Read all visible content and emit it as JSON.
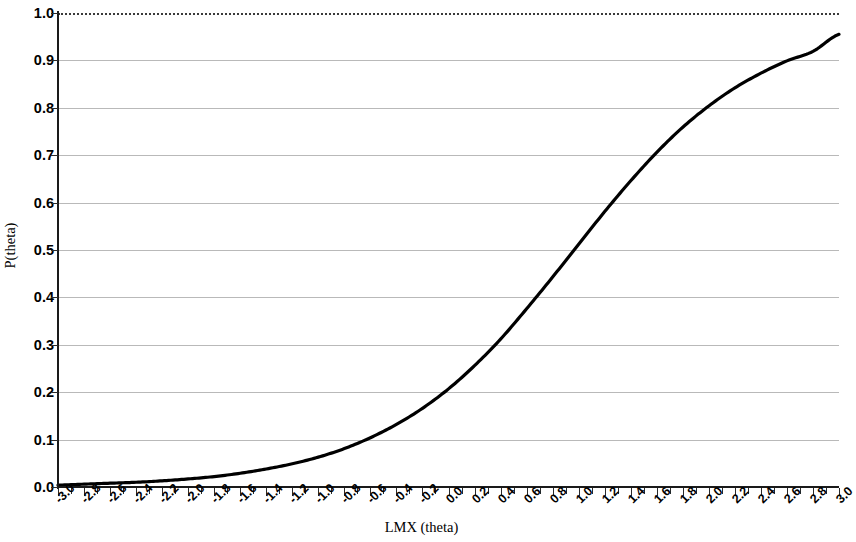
{
  "chart_data": {
    "type": "line",
    "title": "",
    "subtitle": "",
    "xlabel": "LMX (theta)",
    "ylabel": "P(theta)",
    "xlim": [
      -3.0,
      3.0
    ],
    "ylim": [
      0.0,
      1.0
    ],
    "grid": true,
    "legend": null,
    "legend_position": "none",
    "annotations": [],
    "line_color": "#000000",
    "gridline_color": "#b9b9b9",
    "axis_color": "#1a1a1a",
    "x_tick_labels": [
      "-3.0",
      "-2.8",
      "-2.6",
      "-2.4",
      "-2.2",
      "-2.0",
      "-1.8",
      "-1.6",
      "-1.4",
      "-1.2",
      "-1.0",
      "-0.8",
      "-0.6",
      "-0.4",
      "-0.2",
      "0.0",
      "0.2",
      "0.4",
      "0.6",
      "0.8",
      "1.0",
      "1.2",
      "1.4",
      "1.6",
      "1.8",
      "2.0",
      "2.2",
      "2.4",
      "2.6",
      "2.8",
      "3.0"
    ],
    "y_tick_labels": [
      "0.0",
      "0.1",
      "0.2",
      "0.3",
      "0.4",
      "0.5",
      "0.6",
      "0.7",
      "0.8",
      "0.9",
      "1.0"
    ],
    "x": [
      -3.0,
      -2.8,
      -2.6,
      -2.4,
      -2.2,
      -2.0,
      -1.8,
      -1.6,
      -1.4,
      -1.2,
      -1.0,
      -0.8,
      -0.6,
      -0.4,
      -0.2,
      0.0,
      0.2,
      0.4,
      0.6,
      0.8,
      1.0,
      1.2,
      1.4,
      1.6,
      1.8,
      2.0,
      2.2,
      2.4,
      2.6,
      2.8,
      3.0
    ],
    "series": [
      {
        "name": "Item characteristic curve",
        "values": [
          0.004,
          0.006,
          0.008,
          0.01,
          0.013,
          0.017,
          0.022,
          0.029,
          0.038,
          0.049,
          0.063,
          0.081,
          0.104,
          0.132,
          0.166,
          0.207,
          0.256,
          0.312,
          0.376,
          0.443,
          0.512,
          0.581,
          0.646,
          0.706,
          0.759,
          0.804,
          0.842,
          0.873,
          0.899,
          0.919,
          0.955
        ]
      }
    ]
  }
}
